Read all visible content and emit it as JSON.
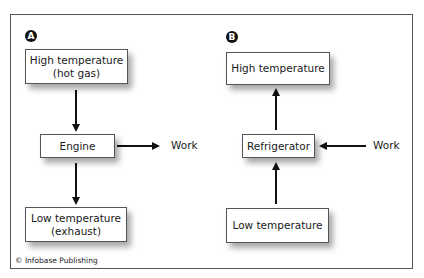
{
  "diagram": {
    "panel_a": {
      "badge": "A",
      "high_box": "High temperature\n(hot gas)",
      "high_line1": "High temperature",
      "high_line2": "(hot gas)",
      "engine_box": "Engine",
      "work_label": "Work",
      "low_line1": "Low temperature",
      "low_line2": "(exhaust)"
    },
    "panel_b": {
      "badge": "B",
      "high_box": "High temperature",
      "refrigerator_box": "Refrigerator",
      "work_label": "Work",
      "low_box": "Low temperature"
    },
    "credit": "© Infobase Publishing",
    "colors": {
      "border": "#555555",
      "arrow": "#111111",
      "badge": "#111111"
    }
  }
}
